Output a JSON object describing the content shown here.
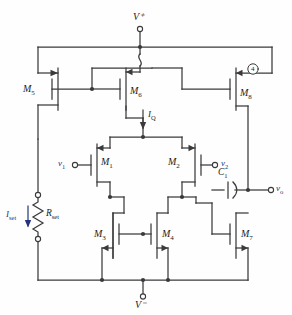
{
  "figure": {
    "type": "circuit-schematic",
    "line_color": "#3a3a3a",
    "label_color": "#1c1c1c",
    "signal_color": "#23357a",
    "background": "#fefefe"
  },
  "rails": {
    "positive": "V⁺",
    "negative": "V⁻"
  },
  "transistors": [
    {
      "id": "M1",
      "label": "M",
      "sub": "1",
      "type": "PMOS",
      "role": "differential-input-left"
    },
    {
      "id": "M2",
      "label": "M",
      "sub": "2",
      "type": "PMOS",
      "role": "differential-input-right"
    },
    {
      "id": "M3",
      "label": "M",
      "sub": "3",
      "type": "NMOS",
      "role": "current-mirror-load-left"
    },
    {
      "id": "M4",
      "label": "M",
      "sub": "4",
      "type": "NMOS",
      "role": "current-mirror-load-right"
    },
    {
      "id": "M5",
      "label": "M",
      "sub": "5",
      "type": "PMOS",
      "role": "bias-mirror-reference"
    },
    {
      "id": "M6",
      "label": "M",
      "sub": "6",
      "type": "PMOS",
      "role": "tail-current-source"
    },
    {
      "id": "M7",
      "label": "M",
      "sub": "7",
      "type": "NMOS",
      "role": "output-stage-sink"
    },
    {
      "id": "M8",
      "label": "M",
      "sub": "8",
      "type": "PMOS",
      "role": "output-stage-source"
    }
  ],
  "passives": [
    {
      "id": "Rset",
      "label": "R",
      "sub": "set",
      "kind": "resistor"
    },
    {
      "id": "C1",
      "label": "C",
      "sub": "1",
      "kind": "capacitor"
    }
  ],
  "currents": [
    {
      "id": "Iset",
      "label": "I",
      "sub": "set",
      "direction": "down"
    },
    {
      "id": "IQ",
      "label": "I",
      "sub": "Q",
      "direction": "down"
    }
  ],
  "signals": [
    {
      "id": "v1",
      "label": "v",
      "sub": "1",
      "kind": "input",
      "side": "left"
    },
    {
      "id": "v2",
      "label": "v",
      "sub": "2",
      "kind": "input",
      "side": "right"
    },
    {
      "id": "vo",
      "label": "v",
      "sub": "o",
      "kind": "output",
      "side": "right"
    }
  ],
  "callouts": [
    {
      "id": "callout-4",
      "text": "4"
    }
  ]
}
